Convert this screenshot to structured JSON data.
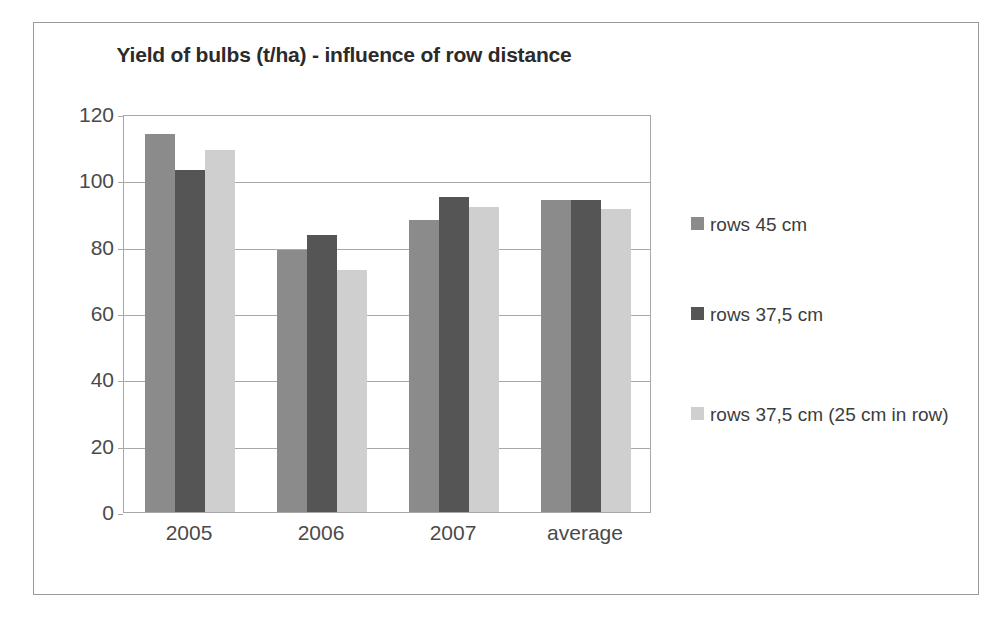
{
  "chart_data": {
    "type": "bar",
    "title": "Yield of bulbs (t/ha) - influence of row distance",
    "xlabel": "",
    "ylabel": "",
    "ylim": [
      0,
      120
    ],
    "ytick_values": [
      120,
      100,
      80,
      60,
      40,
      20,
      0
    ],
    "ytick_labels": [
      "120",
      "100",
      "80",
      "60",
      "40",
      "20",
      "0"
    ],
    "grid": true,
    "legend_position": "right",
    "categories": [
      "2005",
      "2006",
      "2007",
      "average"
    ],
    "series": [
      {
        "name": "rows 45 cm",
        "color": "#8b8b8b",
        "values": [
          114,
          79,
          88,
          94
        ]
      },
      {
        "name": "rows 37,5 cm",
        "color": "#555555",
        "values": [
          103,
          83.5,
          95,
          94
        ]
      },
      {
        "name": "rows 37,5 cm (25 cm in row)",
        "color": "#cfcfcf",
        "values": [
          109,
          73,
          92,
          91.5
        ]
      }
    ]
  }
}
